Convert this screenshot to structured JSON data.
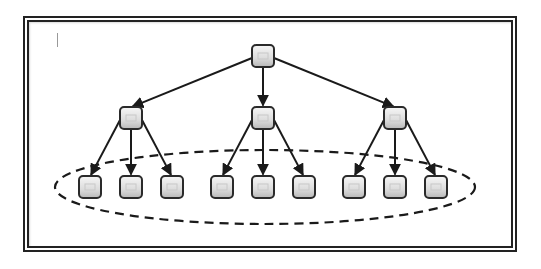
{
  "diagram": {
    "type": "tree",
    "frame": {
      "style": "double-line",
      "color": "#222222"
    },
    "text_cursor": {
      "visible": true
    },
    "colors": {
      "node_border": "#2a2a2a",
      "node_fill_top": "#f4f4f4",
      "node_fill_bottom": "#bdbdbd",
      "edge": "#1a1a1a",
      "ellipse": "#1a1a1a"
    },
    "nodes": [
      {
        "id": "root",
        "level": 0,
        "x": 263,
        "y": 56
      },
      {
        "id": "mid-left",
        "level": 1,
        "x": 131,
        "y": 118
      },
      {
        "id": "mid-center",
        "level": 1,
        "x": 263,
        "y": 118
      },
      {
        "id": "mid-right",
        "level": 1,
        "x": 395,
        "y": 118
      },
      {
        "id": "leaf-1",
        "level": 2,
        "x": 90,
        "y": 187
      },
      {
        "id": "leaf-2",
        "level": 2,
        "x": 131,
        "y": 187
      },
      {
        "id": "leaf-3",
        "level": 2,
        "x": 172,
        "y": 187
      },
      {
        "id": "leaf-4",
        "level": 2,
        "x": 222,
        "y": 187
      },
      {
        "id": "leaf-5",
        "level": 2,
        "x": 263,
        "y": 187
      },
      {
        "id": "leaf-6",
        "level": 2,
        "x": 304,
        "y": 187
      },
      {
        "id": "leaf-7",
        "level": 2,
        "x": 354,
        "y": 187
      },
      {
        "id": "leaf-8",
        "level": 2,
        "x": 395,
        "y": 187
      },
      {
        "id": "leaf-9",
        "level": 2,
        "x": 436,
        "y": 187
      }
    ],
    "edges": [
      [
        "root",
        "mid-left"
      ],
      [
        "root",
        "mid-center"
      ],
      [
        "root",
        "mid-right"
      ],
      [
        "mid-left",
        "leaf-1"
      ],
      [
        "mid-left",
        "leaf-2"
      ],
      [
        "mid-left",
        "leaf-3"
      ],
      [
        "mid-center",
        "leaf-4"
      ],
      [
        "mid-center",
        "leaf-5"
      ],
      [
        "mid-center",
        "leaf-6"
      ],
      [
        "mid-right",
        "leaf-7"
      ],
      [
        "mid-right",
        "leaf-8"
      ],
      [
        "mid-right",
        "leaf-9"
      ]
    ],
    "group": {
      "shape": "dashed-ellipse",
      "encloses": [
        "leaf-1",
        "leaf-2",
        "leaf-3",
        "leaf-4",
        "leaf-5",
        "leaf-6",
        "leaf-7",
        "leaf-8",
        "leaf-9"
      ],
      "cx": 265,
      "cy": 187,
      "rx": 210,
      "ry": 37
    }
  }
}
